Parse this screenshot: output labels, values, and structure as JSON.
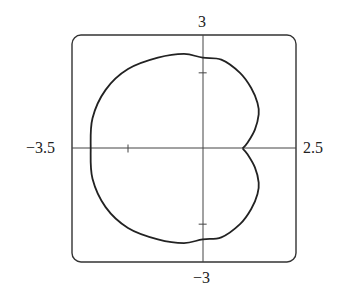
{
  "chart_data": {
    "type": "line",
    "title": "",
    "xlabel": "",
    "ylabel": "",
    "xlim": [
      -3.5,
      2.5
    ],
    "ylim": [
      -3,
      3
    ],
    "grid": false,
    "tick_labels": {
      "xmin": "−3.5",
      "xmax": "2.5",
      "ymin": "−3",
      "ymax": "3"
    },
    "ticks": {
      "x": [
        -2
      ],
      "y": [
        2,
        -2
      ]
    },
    "series": [
      {
        "name": "polar curve",
        "description": "closed cardioid-like limaçon with dimple/cusp at (1,0)",
        "x": [
          1.07,
          1.2,
          1.4,
          1.5,
          1.47,
          1.3,
          1.0,
          0.5,
          0.0,
          -0.5,
          -1.2,
          -2.0,
          -2.6,
          -2.95,
          -3.0,
          -2.95,
          -2.6,
          -2.0,
          -1.2,
          -0.5,
          0.0,
          0.5,
          1.0,
          1.3,
          1.47,
          1.5,
          1.4,
          1.2,
          1.07
        ],
        "y": [
          0.0,
          0.15,
          0.5,
          0.9,
          1.2,
          1.6,
          2.0,
          2.35,
          2.4,
          2.5,
          2.4,
          2.1,
          1.55,
          0.8,
          0.0,
          -0.8,
          -1.55,
          -2.1,
          -2.4,
          -2.5,
          -2.4,
          -2.35,
          -2.0,
          -1.6,
          -1.2,
          -0.9,
          -0.5,
          -0.15,
          0.0
        ]
      }
    ]
  }
}
